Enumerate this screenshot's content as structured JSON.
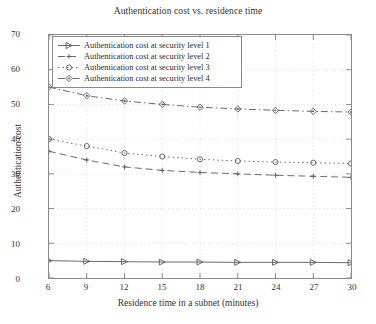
{
  "chart_data": {
    "type": "line",
    "title": "Authentication cost vs. residence time",
    "xlabel": "Residence time in a subnet (minutes)",
    "ylabel": "Authentication cost",
    "x": [
      6,
      9,
      12,
      15,
      18,
      21,
      24,
      27,
      30
    ],
    "xlim": [
      6,
      30
    ],
    "ylim": [
      0,
      70
    ],
    "xticks": [
      "6",
      "9",
      "12",
      "15",
      "18",
      "21",
      "24",
      "27",
      "30"
    ],
    "yticks": [
      "0",
      "10",
      "20",
      "30",
      "40",
      "50",
      "60",
      "70"
    ],
    "grid": true,
    "grid_style": "dotted",
    "legend_position": "upper left",
    "series": [
      {
        "name": "Authentication cost at security level 1",
        "marker": "right-triangle",
        "line_style": "solid",
        "color": "#595959",
        "values": [
          5.0,
          4.8,
          4.7,
          4.6,
          4.6,
          4.5,
          4.5,
          4.5,
          4.4
        ]
      },
      {
        "name": "Authentication cost at security level 2",
        "marker": "plus",
        "line_style": "dashed",
        "color": "#595959",
        "values": [
          36.5,
          34.0,
          32.0,
          31.0,
          30.4,
          30.0,
          29.6,
          29.3,
          29.0
        ]
      },
      {
        "name": "Authentication cost at security level 3",
        "marker": "circle",
        "line_style": "dotted",
        "color": "#595959",
        "values": [
          40.0,
          38.0,
          36.0,
          35.0,
          34.2,
          33.7,
          33.4,
          33.2,
          33.0
        ]
      },
      {
        "name": "Authentication cost at security level 4",
        "marker": "diamond",
        "line_style": "dash-dot",
        "color": "#595959",
        "values": [
          55.0,
          52.5,
          51.0,
          50.0,
          49.2,
          48.7,
          48.3,
          48.0,
          47.8
        ]
      }
    ]
  },
  "legend": {
    "items": [
      {
        "label": "Authentication cost at security level 1",
        "marker": "right-triangle"
      },
      {
        "label": "Authentication cost at security level 2",
        "marker": "plus"
      },
      {
        "label": "Authentication cost at security level 3",
        "marker": "circle"
      },
      {
        "label": "Authentication cost at security level 4",
        "marker": "diamond"
      }
    ]
  }
}
